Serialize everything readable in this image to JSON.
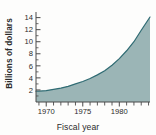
{
  "chart_data": {
    "type": "area",
    "title": "",
    "xlabel": "Fiscal year",
    "ylabel": "Billions of dollars",
    "xlim": [
      1968.6,
      1984.2
    ],
    "ylim": [
      0,
      14.6
    ],
    "grid": false,
    "legend": null,
    "y_ticks": [
      2,
      4,
      6,
      8,
      10,
      12,
      14
    ],
    "y_tick_labels": [
      "2",
      "4",
      "6",
      "8",
      "10",
      "12",
      "14"
    ],
    "y_minor_ticks": [
      1,
      3,
      5,
      7,
      9,
      11,
      13
    ],
    "x_ticks": [
      1970,
      1975,
      1980
    ],
    "x_tick_labels": [
      "1970",
      "1975",
      "1980"
    ],
    "x_minor_ticks": [
      1969,
      1971,
      1972,
      1973,
      1974,
      1976,
      1977,
      1978,
      1979,
      1981,
      1982,
      1983,
      1984
    ],
    "x": [
      1968.6,
      1969,
      1970,
      1971,
      1972,
      1973,
      1974,
      1975,
      1976,
      1977,
      1978,
      1979,
      1980,
      1981,
      1982,
      1983,
      1984.2
    ],
    "values": [
      1.8,
      1.8,
      1.9,
      2.1,
      2.3,
      2.6,
      3.0,
      3.4,
      3.9,
      4.5,
      5.2,
      6.1,
      7.2,
      8.5,
      10.0,
      11.9,
      14.1
    ],
    "series": [
      {
        "name": "Billions of dollars",
        "values": [
          1.8,
          1.8,
          1.9,
          2.1,
          2.3,
          2.6,
          3.0,
          3.4,
          3.9,
          4.5,
          5.2,
          6.1,
          7.2,
          8.5,
          10.0,
          11.9,
          14.1
        ]
      }
    ],
    "colors": {
      "fill": "#9bb5b6",
      "stroke": "#2f6b73",
      "axis": "#4a4a4a",
      "text": "#2b2b2b",
      "background": "#fdfdfc"
    }
  }
}
